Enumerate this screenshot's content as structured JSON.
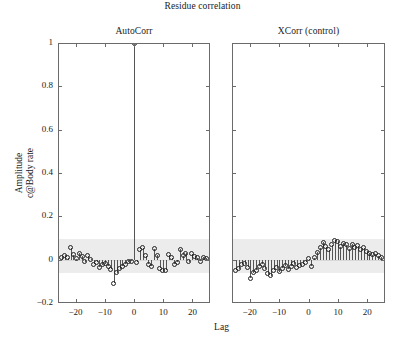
{
  "figure": {
    "title": "Residue correlation",
    "xlabel": "Lag",
    "ylabel_line1": "Amplitude",
    "ylabel_line2": "c@Body rate",
    "band_color": "#ececec",
    "marker_color": "#232323",
    "stem_color": "#555555",
    "axis_color": "#6b6b6b"
  },
  "panels": [
    {
      "title": "AutoCorr"
    },
    {
      "title": "XCorr (control)"
    }
  ],
  "axes": {
    "ylim": [
      -0.2,
      1.0
    ],
    "yticks": [
      1,
      0.8,
      0.6,
      0.4,
      0.2,
      0,
      -0.2
    ],
    "yticklabels": [
      "1",
      "0.8",
      "0.6",
      "0.4",
      "0.2",
      "0",
      "-0.2"
    ],
    "xlim": [
      -26,
      26
    ],
    "xticks": [
      -20,
      -10,
      0,
      10,
      20
    ],
    "xticklabels": [
      "-20",
      "-10",
      "0",
      "10",
      "20"
    ],
    "grid": false
  },
  "chart_data": {
    "type": "line",
    "subtype": "stem",
    "title": "Residue correlation",
    "xlabel": "Lag",
    "ylabel": "Amplitude c@Body rate",
    "ylim": [
      -0.2,
      1.0
    ],
    "xlim": [
      -26,
      26
    ],
    "yticks": [
      1,
      0.8,
      0.6,
      0.4,
      0.2,
      0,
      -0.2
    ],
    "xticks": [
      -20,
      -10,
      0,
      10,
      20
    ],
    "grid": false,
    "legend": "none",
    "panels": [
      {
        "name": "AutoCorr",
        "confidence_band": [
          -0.062,
          0.095
        ],
        "x": [
          -25,
          -24,
          -23,
          -22,
          -21,
          -20,
          -19,
          -18,
          -17,
          -16,
          -15,
          -14,
          -13,
          -12,
          -11,
          -10,
          -9,
          -8,
          -7,
          -6,
          -5,
          -4,
          -3,
          -2,
          -1,
          0,
          1,
          2,
          3,
          4,
          5,
          6,
          7,
          8,
          9,
          10,
          11,
          12,
          13,
          14,
          15,
          16,
          17,
          18,
          19,
          20,
          21,
          22,
          23,
          24,
          25
        ],
        "y": [
          0.012,
          0.02,
          0.008,
          0.055,
          0.022,
          0.005,
          0.03,
          0.015,
          -0.01,
          0.018,
          0.002,
          -0.02,
          -0.012,
          -0.035,
          -0.024,
          -0.018,
          -0.03,
          -0.045,
          -0.108,
          -0.06,
          -0.042,
          -0.03,
          -0.02,
          -0.01,
          -0.008,
          1.0,
          -0.012,
          0.045,
          0.055,
          0.018,
          -0.02,
          -0.03,
          0.05,
          0.02,
          -0.04,
          -0.052,
          -0.05,
          0.022,
          0.01,
          -0.02,
          -0.012,
          0.048,
          0.018,
          0.03,
          -0.01,
          0.028,
          0.015,
          0.008,
          -0.008,
          0.012,
          0.006
        ]
      },
      {
        "name": "XCorr (control)",
        "confidence_band": [
          -0.062,
          0.095
        ],
        "x": [
          -25,
          -24,
          -23,
          -22,
          -21,
          -20,
          -19,
          -18,
          -17,
          -16,
          -15,
          -14,
          -13,
          -12,
          -11,
          -10,
          -9,
          -8,
          -7,
          -6,
          -5,
          -4,
          -3,
          -2,
          -1,
          0,
          1,
          2,
          3,
          4,
          5,
          6,
          7,
          8,
          9,
          10,
          11,
          12,
          13,
          14,
          15,
          16,
          17,
          18,
          19,
          20,
          21,
          22,
          23,
          24,
          25
        ],
        "y": [
          -0.05,
          -0.042,
          -0.02,
          -0.018,
          -0.035,
          -0.085,
          -0.06,
          -0.048,
          -0.03,
          -0.02,
          -0.042,
          -0.065,
          -0.075,
          -0.05,
          -0.038,
          -0.055,
          -0.04,
          -0.028,
          -0.045,
          -0.03,
          -0.018,
          -0.035,
          -0.026,
          -0.02,
          -0.012,
          0.005,
          -0.03,
          0.01,
          0.035,
          0.055,
          0.08,
          0.06,
          0.045,
          0.07,
          0.09,
          0.085,
          0.06,
          0.075,
          0.068,
          0.05,
          0.072,
          0.058,
          0.065,
          0.048,
          0.055,
          0.04,
          0.03,
          0.022,
          0.028,
          0.018,
          0.012
        ]
      }
    ]
  }
}
